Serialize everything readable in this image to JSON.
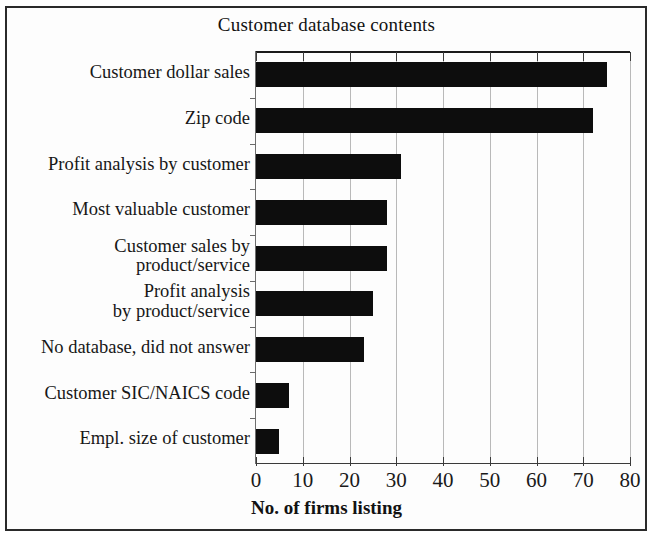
{
  "figure": {
    "title": "Customer database contents",
    "xaxis_title": "No. of firms listing",
    "frame_color": "#2a2a2a",
    "bar_color": "#0d0d0d"
  },
  "chart_data": {
    "type": "bar",
    "orientation": "horizontal",
    "title": "Customer database contents",
    "xlabel": "No. of firms listing",
    "ylabel": "",
    "xlim": [
      0,
      80
    ],
    "xticks": [
      0,
      10,
      20,
      30,
      40,
      50,
      60,
      70,
      80
    ],
    "xtick_labels": [
      "0",
      "10",
      "20",
      "30",
      "40",
      "50",
      "60",
      "70",
      "80"
    ],
    "grid": true,
    "grid_axis": "x",
    "legend": false,
    "categories": [
      "Customer dollar sales",
      "Zip code",
      "Profit analysis by customer",
      "Most valuable customer",
      "Customer sales by\nproduct/service",
      "Profit analysis\nby product/service",
      "No database, did not answer",
      "Customer SIC/NAICS code",
      "Empl. size of customer"
    ],
    "values": [
      75,
      72,
      31,
      28,
      28,
      25,
      23,
      7,
      5
    ]
  },
  "bars": [
    {
      "label": "Customer dollar sales",
      "value": 75
    },
    {
      "label": "Zip code",
      "value": 72
    },
    {
      "label": "Profit analysis by customer",
      "value": 31
    },
    {
      "label": "Most valuable customer",
      "value": 28
    },
    {
      "label": "Customer sales by\nproduct/service",
      "value": 28
    },
    {
      "label": "Profit analysis\nby product/service",
      "value": 25
    },
    {
      "label": "No database, did not answer",
      "value": 23
    },
    {
      "label": "Customer SIC/NAICS code",
      "value": 7
    },
    {
      "label": "Empl. size of customer",
      "value": 5
    }
  ]
}
